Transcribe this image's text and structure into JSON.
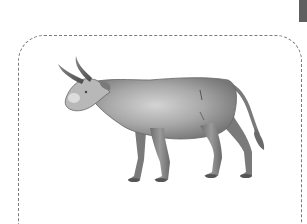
{
  "card": {
    "frame_style": "dashed-rounded",
    "frame_color": "#7a7a7a",
    "corner_tab_color": "#5f5f5f"
  },
  "illustration": {
    "subject": "bull",
    "icon": "bull-illustration",
    "palette": {
      "body_light": "#c9c9c9",
      "body_mid": "#9a9a9a",
      "body_dark": "#6e6e6e",
      "outline": "#555555"
    }
  }
}
